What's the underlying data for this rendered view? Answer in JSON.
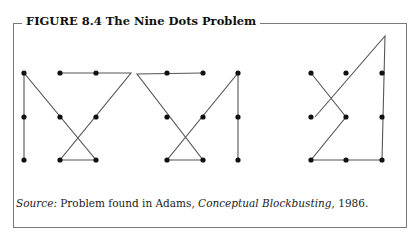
{
  "figure": {
    "label": "FIGURE 8.4",
    "title": "The Nine Dots Problem",
    "full_title": "FIGURE 8.4  The Nine Dots Problem"
  },
  "source": {
    "prefix": "Source:",
    "text_before": " Problem found in Adams, ",
    "book": "Conceptual Blockbusting",
    "text_after": ", 1986."
  },
  "puzzles": [
    {
      "name": "solution-1",
      "dots": [
        [
          24,
          73
        ],
        [
          60,
          73
        ],
        [
          96,
          73
        ],
        [
          24,
          117
        ],
        [
          60,
          117
        ],
        [
          96,
          117
        ],
        [
          24,
          160
        ],
        [
          60,
          160
        ],
        [
          96,
          160
        ]
      ],
      "path": [
        [
          24,
          160
        ],
        [
          24,
          73
        ],
        [
          96,
          160
        ],
        [
          60,
          160
        ],
        [
          131,
          73
        ],
        [
          60,
          73
        ]
      ]
    },
    {
      "name": "solution-2",
      "dots": [
        [
          167,
          73
        ],
        [
          203,
          73
        ],
        [
          238,
          73
        ],
        [
          167,
          117
        ],
        [
          203,
          117
        ],
        [
          238,
          117
        ],
        [
          167,
          160
        ],
        [
          203,
          160
        ],
        [
          238,
          160
        ]
      ],
      "path": [
        [
          203,
          73
        ],
        [
          137,
          74
        ],
        [
          203,
          160
        ],
        [
          167,
          160
        ],
        [
          238,
          73
        ],
        [
          238,
          160
        ]
      ]
    },
    {
      "name": "solution-3",
      "dots": [
        [
          311,
          73
        ],
        [
          346,
          73
        ],
        [
          382,
          73
        ],
        [
          311,
          117
        ],
        [
          346,
          117
        ],
        [
          382,
          117
        ],
        [
          311,
          160
        ],
        [
          346,
          160
        ],
        [
          382,
          160
        ]
      ],
      "path": [
        [
          311,
          73
        ],
        [
          346,
          117
        ],
        [
          311,
          160
        ],
        [
          382,
          160
        ],
        [
          385,
          36
        ],
        [
          315,
          117
        ]
      ]
    }
  ],
  "colors": {
    "line": "#555555",
    "dot": "#111111",
    "frame": "#7a7a7a"
  }
}
